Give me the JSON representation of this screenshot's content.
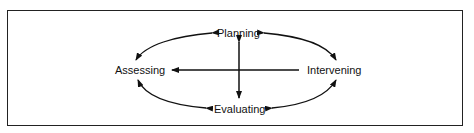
{
  "diagram": {
    "type": "cycle",
    "nodes": {
      "planning": "Planning",
      "assessing": "Assessing",
      "intervening": "Intervening",
      "evaluating": "Evaluating"
    },
    "edges": [
      {
        "from": "Planning",
        "to": "Assessing",
        "bidirectional": true
      },
      {
        "from": "Planning",
        "to": "Intervening",
        "bidirectional": true
      },
      {
        "from": "Evaluating",
        "to": "Assessing",
        "bidirectional": true
      },
      {
        "from": "Evaluating",
        "to": "Intervening",
        "bidirectional": true
      },
      {
        "from": "Planning",
        "to": "Evaluating",
        "bidirectional": true
      },
      {
        "from": "Intervening",
        "to": "Assessing",
        "bidirectional": false
      }
    ],
    "colors": {
      "stroke": "#111111",
      "background": "#ffffff"
    }
  }
}
